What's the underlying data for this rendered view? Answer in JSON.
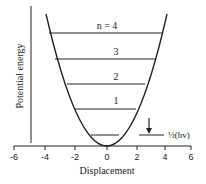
{
  "xlabel": "Displacement",
  "ylabel": "Potential energy",
  "x_ticks": [
    "-6",
    "-4",
    "-2",
    "0",
    "2",
    "4",
    "6"
  ],
  "levels": [
    {
      "n": 0,
      "label": ""
    },
    {
      "n": 1,
      "label": "1"
    },
    {
      "n": 2,
      "label": "2"
    },
    {
      "n": 3,
      "label": "3"
    },
    {
      "n": 4,
      "label": "n = 4"
    }
  ],
  "zero_point_label": "½(hv)",
  "colors": {
    "ink": "#222222",
    "background": "#ffffff"
  }
}
